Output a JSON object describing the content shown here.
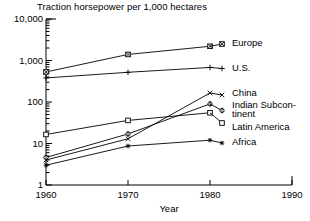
{
  "chart_data": {
    "type": "line",
    "title": "Traction horsepower per 1,000 hectares",
    "xlabel": "Year",
    "ylabel": "",
    "yscale": "log",
    "ylim": [
      1,
      10000
    ],
    "xlim": [
      1960,
      1990
    ],
    "grid": false,
    "legend_position": "right-inline-labels",
    "ytick_labels": [
      "10,000",
      "1,000",
      "100",
      "10",
      "1"
    ],
    "ytick_values": [
      10000,
      1000,
      100,
      10,
      1
    ],
    "xtick_labels": [
      "1960",
      "1970",
      "1980",
      "1990"
    ],
    "xtick_values": [
      1960,
      1970,
      1980,
      1990
    ],
    "x": [
      1960,
      1970,
      1980
    ],
    "series": [
      {
        "name": "Europe",
        "label": "Europe",
        "marker": "box-cross-marker",
        "values": [
          530,
          1400,
          2200
        ]
      },
      {
        "name": "U.S.",
        "label": "U.S.",
        "marker": "plus-marker",
        "values": [
          380,
          520,
          680
        ]
      },
      {
        "name": "China",
        "label": "China",
        "marker": "cross-x-marker",
        "values": [
          4.0,
          13.0,
          165
        ]
      },
      {
        "name": "Indian Subcontinent",
        "label": "Indian Subcon-",
        "label_line2": "tinent",
        "marker": "diamond-marker",
        "values": [
          4.6,
          17.0,
          90
        ]
      },
      {
        "name": "Latin America",
        "label": "Latin America",
        "marker": "square-marker",
        "values": [
          16.5,
          36,
          55
        ]
      },
      {
        "name": "Africa",
        "label": "Africa",
        "marker": "asterisk-marker",
        "values": [
          3.0,
          8.7,
          12.0
        ]
      }
    ]
  },
  "axes": {
    "title": "Traction horsepower per 1,000 hectares",
    "x_axis_name": "Year",
    "y_ticks": [
      {
        "label": "10,000",
        "value": 10000
      },
      {
        "label": "1,000",
        "value": 1000
      },
      {
        "label": "100",
        "value": 100
      },
      {
        "label": "10",
        "value": 10
      },
      {
        "label": "1",
        "value": 1
      }
    ],
    "x_ticks": [
      {
        "label": "1960",
        "value": 1960
      },
      {
        "label": "1970",
        "value": 1970
      },
      {
        "label": "1980",
        "value": 1980
      },
      {
        "label": "1990",
        "value": 1990
      }
    ]
  },
  "colors": {
    "line": "#000000",
    "axis": "#000000",
    "background": "#ffffff",
    "text": "#000000"
  }
}
